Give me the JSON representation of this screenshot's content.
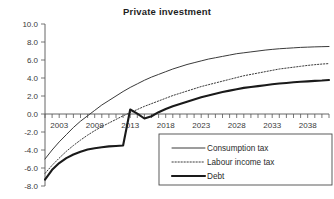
{
  "chart_data": {
    "type": "line",
    "title": "Private investment",
    "xlabel": "",
    "ylabel": "",
    "grid": false,
    "legend_position": "lower-right",
    "xlim": [
      2001,
      2041
    ],
    "ylim": [
      -8.0,
      10.0
    ],
    "ytick_labels": [
      "10.0",
      "8.0",
      "6.0",
      "4.0",
      "2.0",
      "0.0",
      "-2.0",
      "-4.0",
      "-6.0",
      "-8.0"
    ],
    "ytick_values": [
      10.0,
      8.0,
      6.0,
      4.0,
      2.0,
      0.0,
      -2.0,
      -4.0,
      -6.0,
      -8.0
    ],
    "xtick_labels": [
      "2003",
      "2008",
      "2013",
      "2018",
      "2023",
      "2028",
      "2033",
      "2038"
    ],
    "xtick_values": [
      2003,
      2008,
      2013,
      2018,
      2023,
      2028,
      2033,
      2038
    ],
    "xtick_minor_step": 1,
    "x": [
      2001,
      2002,
      2003,
      2004,
      2005,
      2006,
      2007,
      2008,
      2009,
      2010,
      2011,
      2012,
      2013,
      2014,
      2015,
      2016,
      2017,
      2018,
      2019,
      2020,
      2021,
      2022,
      2023,
      2024,
      2025,
      2026,
      2027,
      2028,
      2029,
      2030,
      2031,
      2032,
      2033,
      2034,
      2035,
      2036,
      2037,
      2038,
      2039,
      2040,
      2041
    ],
    "series": [
      {
        "name": "Consumption tax",
        "style": "solid-thin",
        "values": [
          -5.0,
          -4.0,
          -3.1,
          -2.3,
          -1.5,
          -0.8,
          -0.2,
          0.4,
          1.0,
          1.5,
          2.0,
          2.5,
          2.95,
          3.35,
          3.75,
          4.1,
          4.4,
          4.7,
          5.0,
          5.25,
          5.5,
          5.7,
          5.9,
          6.1,
          6.25,
          6.4,
          6.55,
          6.7,
          6.8,
          6.9,
          7.0,
          7.1,
          7.18,
          7.25,
          7.3,
          7.35,
          7.4,
          7.43,
          7.46,
          7.48,
          7.5
        ]
      },
      {
        "name": "Labour income tax",
        "style": "dotted",
        "values": [
          -6.6,
          -5.7,
          -4.9,
          -4.15,
          -3.5,
          -2.9,
          -2.35,
          -1.85,
          -1.4,
          -1.0,
          -0.6,
          -0.2,
          0.15,
          0.5,
          0.85,
          1.15,
          1.45,
          1.75,
          2.05,
          2.3,
          2.55,
          2.8,
          3.05,
          3.25,
          3.45,
          3.65,
          3.85,
          4.05,
          4.25,
          4.4,
          4.55,
          4.7,
          4.85,
          5.0,
          5.1,
          5.2,
          5.3,
          5.4,
          5.48,
          5.55,
          5.6
        ]
      },
      {
        "name": "Debt",
        "style": "solid-thick",
        "values": [
          -7.3,
          -6.2,
          -5.45,
          -4.9,
          -4.5,
          -4.2,
          -3.95,
          -3.8,
          -3.7,
          -3.6,
          -3.55,
          -3.5,
          0.5,
          0.05,
          -0.5,
          -0.25,
          0.2,
          0.55,
          0.85,
          1.1,
          1.35,
          1.6,
          1.85,
          2.05,
          2.25,
          2.45,
          2.6,
          2.75,
          2.9,
          3.0,
          3.1,
          3.2,
          3.3,
          3.38,
          3.45,
          3.52,
          3.58,
          3.63,
          3.68,
          3.72,
          3.78
        ]
      }
    ]
  },
  "legend": {
    "items": [
      {
        "label": "Consumption tax",
        "style": "solid-thin"
      },
      {
        "label": "Labour income tax",
        "style": "dotted"
      },
      {
        "label": "Debt",
        "style": "solid-thick"
      }
    ]
  }
}
